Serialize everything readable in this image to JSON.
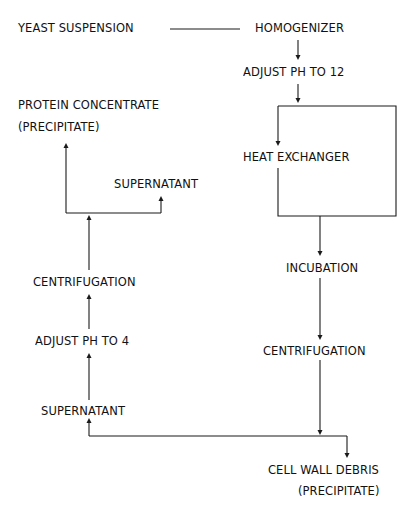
{
  "diagram": {
    "type": "process-flow",
    "nodes": {
      "yeast_suspension": "YEAST SUSPENSION",
      "homogenizer": "HOMOGENIZER",
      "adjust_ph_12": "ADJUST PH TO 12",
      "heat_exchanger": "HEAT EXCHANGER",
      "incubation": "INCUBATION",
      "centrifugation_right": "CENTRIFUGATION",
      "cell_wall_debris": "CELL WALL DEBRIS",
      "cell_wall_debris_note": "(PRECIPITATE)",
      "supernatant_bottom": "SUPERNATANT",
      "adjust_ph_4": "ADJUST PH TO 4",
      "centrifugation_left": "CENTRIFUGATION",
      "supernatant_top": "SUPERNATANT",
      "protein_concentrate": "PROTEIN CONCENTRATE",
      "protein_concentrate_note": "(PRECIPITATE)"
    },
    "edges": [
      {
        "from": "YEAST SUSPENSION",
        "to": "HOMOGENIZER"
      },
      {
        "from": "HOMOGENIZER",
        "to": "ADJUST PH TO 12"
      },
      {
        "from": "ADJUST PH TO 12",
        "to": "HEAT EXCHANGER"
      },
      {
        "from": "HEAT EXCHANGER",
        "to": "INCUBATION"
      },
      {
        "from": "INCUBATION",
        "to": "CENTRIFUGATION"
      },
      {
        "from": "CENTRIFUGATION",
        "to": "CELL WALL DEBRIS (PRECIPITATE)"
      },
      {
        "from": "CENTRIFUGATION",
        "to": "SUPERNATANT"
      },
      {
        "from": "SUPERNATANT",
        "to": "ADJUST PH TO 4"
      },
      {
        "from": "ADJUST PH TO 4",
        "to": "CENTRIFUGATION"
      },
      {
        "from": "CENTRIFUGATION",
        "to": "PROTEIN CONCENTRATE (PRECIPITATE)"
      },
      {
        "from": "CENTRIFUGATION",
        "to": "SUPERNATANT"
      }
    ],
    "colors": {
      "ink": "#111111",
      "background": "#ffffff"
    }
  }
}
